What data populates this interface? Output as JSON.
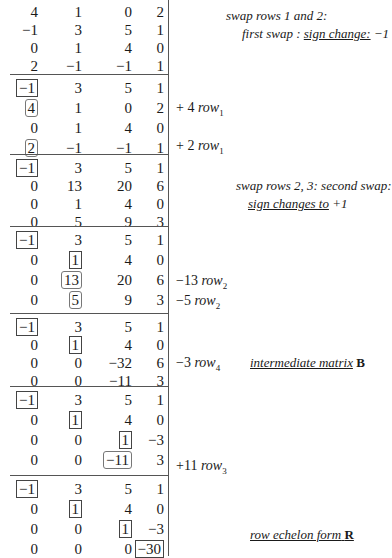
{
  "blocks": [
    {
      "top": 4,
      "rows": [
        [
          "4",
          "1",
          "0",
          "2"
        ],
        [
          "-1",
          "3",
          "5",
          "1"
        ],
        [
          "0",
          "1",
          "4",
          "0"
        ],
        [
          "2",
          "-1",
          "-1",
          "1"
        ]
      ],
      "boxes": [],
      "rounded": []
    },
    {
      "top": 80,
      "rows": [
        [
          "-1",
          "3",
          "5",
          "1"
        ],
        [
          "4",
          "1",
          "0",
          "2"
        ],
        [
          "0",
          "1",
          "4",
          "0"
        ],
        [
          "2",
          "-1",
          "-1",
          "1"
        ]
      ],
      "boxes": [
        [
          0,
          0
        ]
      ],
      "rounded": [
        [
          1,
          0
        ],
        [
          3,
          0
        ]
      ]
    },
    {
      "top": 160,
      "rows": [
        [
          "-1",
          "3",
          "5",
          "1"
        ],
        [
          "0",
          "13",
          "20",
          "6"
        ],
        [
          "0",
          "1",
          "4",
          "0"
        ],
        [
          "0",
          "5",
          "9",
          "3"
        ]
      ],
      "boxes": [
        [
          0,
          0
        ]
      ],
      "rounded": []
    },
    {
      "top": 232,
      "rows": [
        [
          "-1",
          "3",
          "5",
          "1"
        ],
        [
          "0",
          "1",
          "4",
          "0"
        ],
        [
          "0",
          "13",
          "20",
          "6"
        ],
        [
          "0",
          "5",
          "9",
          "3"
        ]
      ],
      "boxes": [
        [
          0,
          0
        ],
        [
          1,
          1
        ]
      ],
      "rounded": [
        [
          2,
          1
        ],
        [
          3,
          1
        ]
      ]
    },
    {
      "top": 319,
      "rows": [
        [
          "-1",
          "3",
          "5",
          "1"
        ],
        [
          "0",
          "1",
          "4",
          "0"
        ],
        [
          "0",
          "0",
          "-32",
          "6"
        ],
        [
          "0",
          "0",
          "-11",
          "3"
        ]
      ],
      "boxes": [
        [
          0,
          0
        ],
        [
          1,
          1
        ]
      ],
      "rounded": []
    },
    {
      "top": 392,
      "rows": [
        [
          "-1",
          "3",
          "5",
          "1"
        ],
        [
          "0",
          "1",
          "4",
          "0"
        ],
        [
          "0",
          "0",
          "1",
          "-3"
        ],
        [
          "0",
          "0",
          "-11",
          "3"
        ]
      ],
      "boxes": [
        [
          0,
          0
        ],
        [
          1,
          1
        ],
        [
          2,
          2
        ]
      ],
      "rounded": [
        [
          3,
          2
        ]
      ]
    },
    {
      "top": 481,
      "rows": [
        [
          "-1",
          "3",
          "5",
          "1"
        ],
        [
          "0",
          "1",
          "4",
          "0"
        ],
        [
          "0",
          "0",
          "1",
          "-3"
        ],
        [
          "0",
          "0",
          "0",
          "-30"
        ]
      ],
      "boxes": [
        [
          0,
          0
        ],
        [
          1,
          1
        ],
        [
          2,
          2
        ],
        [
          3,
          3
        ]
      ],
      "rounded": []
    }
  ],
  "operations": [
    {
      "top": 100,
      "coef": "+ 4",
      "var": "row",
      "sub": "1"
    },
    {
      "top": 138,
      "coef": "+ 2",
      "var": "row",
      "sub": "1"
    },
    {
      "top": 273,
      "coef": "−13",
      "var": "row",
      "sub": "2"
    },
    {
      "top": 293,
      "coef": "−5",
      "var": "row",
      "sub": "2"
    },
    {
      "top": 355,
      "coef": "−3",
      "var": "row",
      "sub": "4"
    },
    {
      "top": 458,
      "coef": "+11",
      "var": "row",
      "sub": "3"
    }
  ],
  "notes": {
    "n1_line1": "swap rows 1 and 2:",
    "n1_line2_pre": "first swap : ",
    "n1_line2_u": "sign change:",
    "n1_line2_post": "  −1",
    "n2_line1": "swap rows 2, 3:   second swap:",
    "n2_line2_u": "sign changes to",
    "n2_line2_post": "  +1",
    "n3_u": "intermediate matrix",
    "n3_bold": "B",
    "n4_u": "row echelon form",
    "n4_bold": "R"
  },
  "separators": [
    74,
    154,
    226,
    313,
    386,
    475
  ]
}
